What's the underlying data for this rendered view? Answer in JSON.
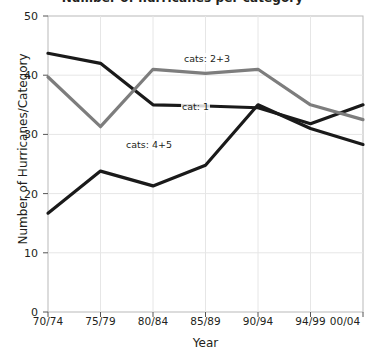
{
  "chart_data": {
    "type": "line",
    "title": "Number of hurricanes per category",
    "xlabel": "Year",
    "ylabel": "Number of Hurricanes/Category",
    "categories": [
      "70/74",
      "75/79",
      "80/84",
      "85/89",
      "90/94",
      "94/99",
      "00/04"
    ],
    "ylim": [
      0,
      50
    ],
    "yticks": [
      0,
      10,
      20,
      30,
      40,
      50
    ],
    "grid": true,
    "legend_position": "inline-annotations",
    "series": [
      {
        "name": "cat: 1",
        "label": "cat: 1",
        "color": "#1a1a1a",
        "values": [
          43.7,
          42.0,
          35.0,
          34.8,
          34.5,
          31.8,
          35.0
        ]
      },
      {
        "name": "cats: 2+3",
        "label": "cats: 2+3",
        "color": "#7d7d7d",
        "values": [
          39.7,
          31.3,
          41.0,
          40.3,
          41.0,
          35.0,
          32.5
        ]
      },
      {
        "name": "cats: 4+5",
        "label": "cats: 4+5",
        "color": "#1a1a1a",
        "values": [
          16.7,
          23.8,
          21.3,
          24.8,
          35.0,
          31.0,
          28.3
        ]
      }
    ],
    "annotations": [
      {
        "text": "cats: 2+3",
        "x": 2.35,
        "y": 44.0
      },
      {
        "text": "cat: 1",
        "x": 2.7,
        "y": 36.6
      },
      {
        "text": "cats: 4+5",
        "x": 1.55,
        "y": 26.0
      }
    ]
  }
}
